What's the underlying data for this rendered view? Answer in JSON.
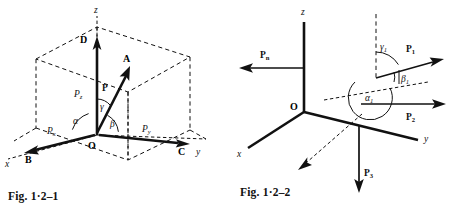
{
  "page": {
    "width": 449,
    "height": 215,
    "background": "#ffffff",
    "ink": "#111111",
    "type": "textbook-figure-pair"
  },
  "figures": [
    {
      "id": "fig-1-2-1",
      "caption": "Fig. 1·2–1",
      "description": "Rectangular components of a force P in a cuboid reference box",
      "axes": [
        {
          "name": "x-axis",
          "label": "x",
          "style": "italic"
        },
        {
          "name": "y-axis",
          "label": "y",
          "style": "italic"
        },
        {
          "name": "z-axis",
          "label": "z",
          "style": "italic"
        }
      ],
      "points": [
        {
          "name": "origin",
          "label": "O"
        },
        {
          "name": "point-a",
          "label": "A"
        },
        {
          "name": "point-b",
          "label": "B"
        },
        {
          "name": "point-c",
          "label": "C"
        },
        {
          "name": "point-d",
          "label": "D"
        }
      ],
      "vectors": [
        {
          "name": "resultant",
          "label": "P",
          "bold": true
        },
        {
          "name": "component-x",
          "label": "P",
          "subscript": "x",
          "bold": false
        },
        {
          "name": "component-y",
          "label": "P",
          "subscript": "y",
          "bold": false
        },
        {
          "name": "component-z",
          "label": "P",
          "subscript": "z",
          "bold": false
        }
      ],
      "angles": [
        {
          "name": "angle-alpha",
          "label": "α",
          "between": "P and x-axis"
        },
        {
          "name": "angle-beta",
          "label": "β",
          "between": "P and y-axis"
        },
        {
          "name": "angle-gamma",
          "label": "γ",
          "between": "P and z-axis"
        }
      ]
    },
    {
      "id": "fig-1-2-2",
      "caption": "Fig. 1·2–2",
      "description": "System of concurrent forces at origin O with direction angles of P1",
      "axes": [
        {
          "name": "x-axis",
          "label": "x",
          "style": "italic"
        },
        {
          "name": "y-axis",
          "label": "y",
          "style": "italic"
        },
        {
          "name": "z-axis",
          "label": "z",
          "style": "italic"
        }
      ],
      "points": [
        {
          "name": "origin",
          "label": "O"
        }
      ],
      "vectors": [
        {
          "name": "force-1",
          "label": "P",
          "subscript": "1",
          "bold": true
        },
        {
          "name": "force-2",
          "label": "P",
          "subscript": "2",
          "bold": true
        },
        {
          "name": "force-3",
          "label": "P",
          "subscript": "3",
          "bold": true
        },
        {
          "name": "force-n",
          "label": "P",
          "subscript": "n",
          "bold": true
        }
      ],
      "angles": [
        {
          "name": "angle-alpha-1",
          "label": "α",
          "subscript": "1"
        },
        {
          "name": "angle-beta-1",
          "label": "β",
          "subscript": "1"
        },
        {
          "name": "angle-gamma-1",
          "label": "γ",
          "subscript": "1"
        }
      ]
    }
  ]
}
